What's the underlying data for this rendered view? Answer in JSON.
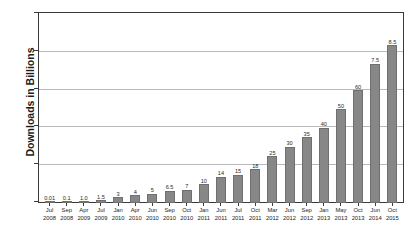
{
  "chart_data": {
    "type": "bar",
    "title": "",
    "xlabel": "",
    "ylabel": "Downloads in Billions",
    "ylim": [
      0,
      100
    ],
    "yticks": [
      0,
      20,
      40,
      60,
      80,
      100
    ],
    "grid": true,
    "legend": "none",
    "bar_color": "#878787",
    "categories": [
      "Jul 2008",
      "Sep 2008",
      "Apr 2009",
      "Jul 2009",
      "Jan 2010",
      "Apr 2010",
      "Jun 2010",
      "Sep 2010",
      "Oct 2010",
      "Jan 2011",
      "Jun 2011",
      "Jul 2011",
      "Oct 2011",
      "Mar 2012",
      "Jun 2012",
      "Sep 2012",
      "Jan 2013",
      "May 2013",
      "Oct 2013",
      "Jun 2014",
      "Oct 2015"
    ],
    "category_months": [
      "Jul",
      "Sep",
      "Apr",
      "Jul",
      "Jan",
      "Apr",
      "Jun",
      "Sep",
      "Oct",
      "Jan",
      "Jun",
      "Jul",
      "Oct",
      "Mar",
      "Jun",
      "Sep",
      "Jan",
      "May",
      "Oct",
      "Jun",
      "Oct"
    ],
    "category_years": [
      "2008",
      "2008",
      "2009",
      "2009",
      "2010",
      "2010",
      "2010",
      "2010",
      "2010",
      "2011",
      "2011",
      "2011",
      "2011",
      "2012",
      "2012",
      "2012",
      "2013",
      "2013",
      "2013",
      "2014",
      "2015"
    ],
    "values": [
      0.01,
      0.1,
      1.0,
      1.5,
      3,
      4,
      5,
      6.5,
      7,
      10,
      14,
      15,
      18,
      25,
      30,
      35,
      40,
      50,
      60,
      74,
      84
    ],
    "value_labels": [
      "0.01",
      "0.1",
      "1.0",
      "1.5",
      "3",
      "4",
      "5",
      "6.5",
      "7",
      "10",
      "14",
      "15",
      "18",
      "25",
      "30",
      "35",
      "40",
      "50",
      "60",
      "7.5",
      "8.5"
    ]
  }
}
